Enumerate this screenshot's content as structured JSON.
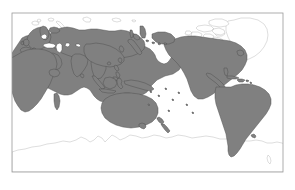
{
  "figure": {
    "type": "world-map",
    "projection": "equirectangular",
    "center_longitude": 150,
    "width_px": 295,
    "height_px": 190,
    "background_color": "#ffffff",
    "title": "",
    "caption": "",
    "legend": ""
  },
  "frame": {
    "x": 12,
    "y": 13,
    "width": 271,
    "height": 159,
    "stroke_color": "#9a9a9a",
    "stroke_width": 0.8,
    "fill_color": "#ffffff"
  },
  "style": {
    "highlight_fill": "#808080",
    "highlight_stroke": "#4d4d4d",
    "unhighlighted_fill": "#ffffff",
    "unhighlighted_stroke": "#b5b5b5",
    "coastline_width": 0.45
  },
  "regions": {
    "highlighted": [
      "Eurasia",
      "Europe",
      "Russia",
      "China",
      "India",
      "Southeast Asia",
      "Japan",
      "Korea",
      "Indonesia",
      "Philippines",
      "New Guinea",
      "Australia",
      "New Zealand",
      "Africa",
      "Madagascar",
      "North America",
      "Central America",
      "Caribbean",
      "South America",
      "British Isles",
      "Sri Lanka",
      "Taiwan",
      "Hainan",
      "Tasmania",
      "Sakhalin",
      "Cuba",
      "Hispaniola",
      "Newfoundland"
    ],
    "outline_only": [
      "Greenland",
      "Canadian Arctic Archipelago",
      "Svalbard",
      "Novaya Zemlya",
      "Severnaya Zemlya",
      "New Siberian Islands",
      "Iceland",
      "Antarctica"
    ]
  },
  "labels": {
    "axis_x": "",
    "axis_y": "",
    "tick_labels": []
  },
  "chart_data": {
    "type": "map",
    "title": "",
    "xlabel": "",
    "ylabel": "",
    "xlim": [
      15,
      285
    ],
    "ylim": [
      -85,
      85
    ],
    "grid": false,
    "legend_position": "none",
    "categories": [
      "Eurasia",
      "Africa",
      "Australia",
      "New Zealand",
      "North America",
      "South America",
      "Greenland",
      "Canadian Arctic",
      "Antarctica"
    ],
    "values": [
      1,
      1,
      1,
      1,
      1,
      1,
      0,
      0,
      0
    ],
    "value_meaning": "1 = shaded gray (highlighted landmass), 0 = outline only",
    "series": [
      {
        "name": "highlighted",
        "values": [
          1,
          1,
          1,
          1,
          1,
          1,
          0,
          0,
          0
        ]
      }
    ]
  }
}
